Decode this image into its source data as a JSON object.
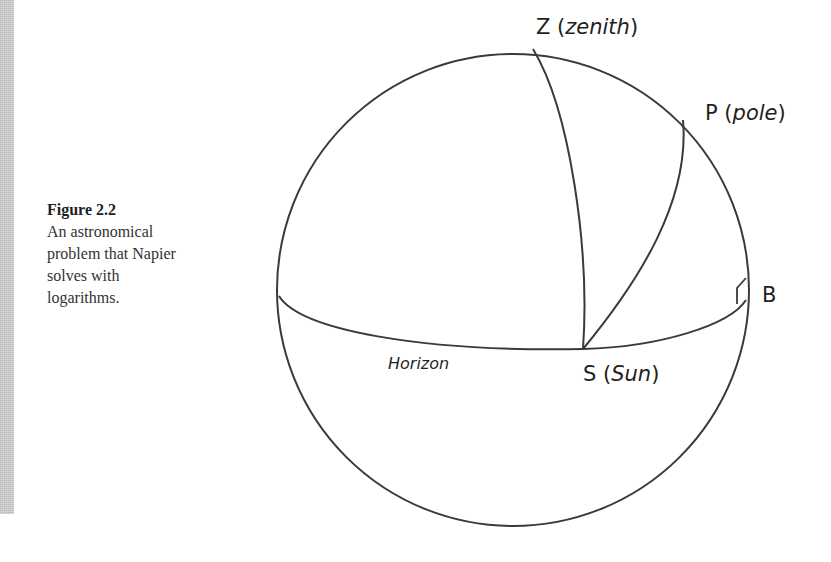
{
  "caption": {
    "title": "Figure 2.2",
    "lines": [
      "An astronomical",
      "problem that Napier",
      "solves with",
      "logarithms."
    ]
  },
  "labels": {
    "zenith": {
      "letter": "Z",
      "open": " (",
      "name": "zenith",
      "close": ")"
    },
    "pole": {
      "letter": "P",
      "open": " (",
      "name": "pole",
      "close": ")"
    },
    "sun": {
      "letter": "S",
      "open": " (",
      "name": "Sun",
      "close": ")"
    },
    "b": {
      "letter": "B"
    },
    "horizon": "Horizon"
  },
  "colors": {
    "stroke": "#3a3a3a",
    "text": "#231f20",
    "margin_bar": "#c9c9c9"
  },
  "geometry": {
    "sphere": {
      "cx": 513,
      "cy": 290,
      "r": 236
    },
    "points": {
      "Z": [
        533,
        49
      ],
      "P": [
        683,
        120
      ],
      "S": [
        583,
        349
      ],
      "B": [
        746,
        300
      ]
    },
    "horizon_path": "M 279 296 C 300 330, 420 352, 583 349 C 660 347, 730 325, 746 300",
    "arc_ZS": "M 533 49 C 570 110, 590 250, 583 349",
    "arc_PS": "M 683 120 C 690 200, 640 280, 583 349",
    "right_angle": "M 746 278 L 737 288 L 737 304"
  }
}
